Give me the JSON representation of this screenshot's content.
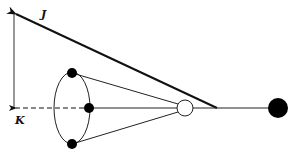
{
  "diagram": {
    "labels": {
      "j": "J",
      "k": "K"
    },
    "colors": {
      "stroke": "#111111",
      "fill_dark": "#000000",
      "fill_open": "#ffffff"
    },
    "nodes": [
      {
        "id": "top-dot",
        "type": "filled",
        "cx": 72,
        "cy": 73,
        "r": 5
      },
      {
        "id": "middle-dot",
        "type": "filled",
        "cx": 89,
        "cy": 108,
        "r": 5
      },
      {
        "id": "bottom-dot",
        "type": "filled",
        "cx": 72,
        "cy": 144,
        "r": 5
      },
      {
        "id": "open-circle",
        "type": "open",
        "cx": 185,
        "cy": 108,
        "r": 8
      },
      {
        "id": "large-dot",
        "type": "filled",
        "cx": 278,
        "cy": 108,
        "r": 10
      }
    ],
    "vectors": [
      {
        "id": "J",
        "from": [
          217,
          108
        ],
        "to": [
          14,
          13
        ],
        "style": "solid-thick"
      },
      {
        "id": "K",
        "from": [
          89,
          108
        ],
        "to": [
          14,
          108
        ],
        "style": "dashed"
      }
    ]
  }
}
